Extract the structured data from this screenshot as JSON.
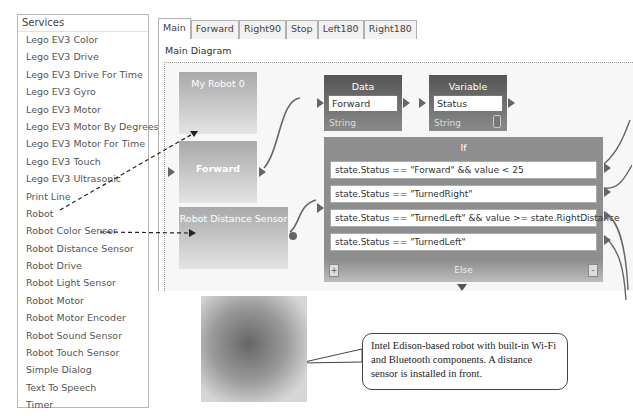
{
  "services": {
    "header": "Services",
    "items": [
      "Lego EV3 Color",
      "Lego EV3 Drive",
      "Lego EV3 Drive For Time",
      "Lego EV3 Gyro",
      "Lego EV3 Motor",
      "Lego EV3 Motor By Degrees",
      "Lego EV3 Motor For Time",
      "Lego EV3 Touch",
      "Lego EV3 Ultrasonic",
      "Print Line",
      "Robot",
      "Robot Color Sensor",
      "Robot Distance Sensor",
      "Robot Drive",
      "Robot Light Sensor",
      "Robot Motor",
      "Robot Motor Encoder",
      "Robot Sound Sensor",
      "Robot Touch Sensor",
      "Simple Dialog",
      "Text To Speech",
      "Timer"
    ]
  },
  "tabs": [
    "Main",
    "Forward",
    "Right90",
    "Stop",
    "Left180",
    "Right180"
  ],
  "active_tab": "Main",
  "diagram": {
    "title": "Main Diagram",
    "blocks": {
      "my_robot": "My Robot 0",
      "forward": "Forward",
      "distance_sensor": "Robot Distance Sensor",
      "data": {
        "title": "Data",
        "value": "Forward",
        "type": "String"
      },
      "variable": {
        "title": "Variable",
        "value": "Status",
        "type": "String"
      },
      "if_block": {
        "title": "If",
        "conditions": [
          "state.Status == \"Forward\" && value < 25",
          "state.Status == \"TurnedRight\"",
          "state.Status == \"TurnedLeft\" && value >= state.RightDistance",
          "state.Status == \"TurnedLeft\""
        ],
        "else_label": "Else",
        "add_button": "+",
        "remove_button": "-"
      }
    }
  },
  "annotation": {
    "text": "Intel Edison-based robot with built-in Wi-Fi and Bluetooth components. A distance sensor is installed in front."
  }
}
